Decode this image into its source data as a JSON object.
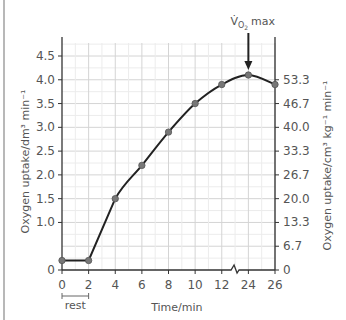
{
  "chart_data": {
    "type": "line",
    "title": "",
    "xlabel": "Time/min",
    "ylabel": "Oxygen uptake/dm³ min⁻¹",
    "ylabel_right": "Oxygen uptake/cm³ kg⁻¹ min⁻¹",
    "x_tick_labels": [
      "0",
      "2",
      "4",
      "6",
      "8",
      "10",
      "12",
      "24",
      "26"
    ],
    "y_ticks": [
      0,
      1.0,
      1.5,
      2.0,
      2.5,
      3.0,
      3.5,
      4.0,
      4.5
    ],
    "y_tick_labels": [
      "0",
      "1.0",
      "1.5",
      "2.0",
      "2.5",
      "3.0",
      "3.5",
      "4.0",
      "4.5"
    ],
    "y_right_ticks": [
      0,
      6.7,
      13.3,
      20.0,
      26.7,
      33.3,
      40.0,
      46.7,
      53.3
    ],
    "y_right_tick_labels": [
      "0",
      "6.7",
      "13.3",
      "20.0",
      "26.7",
      "33.3",
      "40.0",
      "46.7",
      "53.3"
    ],
    "ylim": [
      0,
      4.8
    ],
    "axis_break": "between 12 and 24 on x-axis",
    "grid": true,
    "series": [
      {
        "name": "Oxygen uptake",
        "x": [
          0,
          2,
          4,
          6,
          8,
          10,
          12,
          24,
          26
        ],
        "values": [
          0.2,
          0.2,
          1.5,
          2.2,
          2.9,
          3.5,
          3.9,
          4.1,
          3.9
        ]
      }
    ],
    "annotations": [
      {
        "text": "V̇O₂ max",
        "points_to_x": 24,
        "type": "arrow"
      },
      {
        "text": "rest",
        "span_x": [
          0,
          2
        ],
        "type": "bracket"
      }
    ]
  },
  "labels": {
    "vo2_main": "V̇",
    "vo2_sub": "O",
    "vo2_subsub": "2",
    "vo2_max": "max",
    "rest": "rest",
    "xlabel": "Time/min",
    "ylabel_left": "Oxygen uptake/dm³ min⁻¹",
    "ylabel_right": "Oxygen uptake/cm³ kg⁻¹ min⁻¹"
  },
  "colors": {
    "line": "#222222",
    "marker": "#777777",
    "grid_major": "#d4d4d4",
    "grid_minor": "#ececec",
    "axis": "#333333",
    "text": "#555555"
  }
}
